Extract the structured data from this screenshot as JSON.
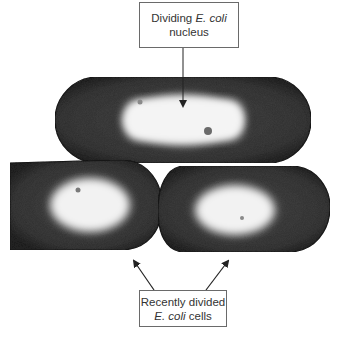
{
  "figure": {
    "labels": {
      "top": {
        "line1_prefix": "Dividing ",
        "line1_italic": "E. coli",
        "line2": "nucleus"
      },
      "bottom": {
        "line1": "Recently divided",
        "line2_italic": "E. coli",
        "line2_suffix": " cells"
      }
    },
    "colors": {
      "background": "#ffffff",
      "cell_cytoplasm": "#3c3c3c",
      "cell_edge": "#1e1e1e",
      "nucleoid": "#f2f2f2",
      "label_border": "#6a6a6a",
      "label_text": "#333333",
      "arrow": "#222222"
    }
  }
}
